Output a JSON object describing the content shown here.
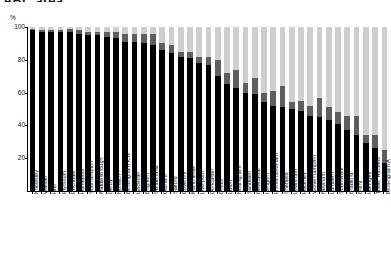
{
  "chart_data": {
    "type": "bar",
    "subtype": "stacked-100-percent",
    "title": "ABC area",
    "title_clipped": true,
    "ylabel": "%",
    "xlabel": "",
    "ylim": [
      0,
      100
    ],
    "yticks": [
      0,
      20,
      40,
      60,
      80,
      100
    ],
    "ytick_labels": [
      "",
      "20",
      "40",
      "60",
      "80",
      "100"
    ],
    "grid": false,
    "legend": "none",
    "colors": {
      "series_1": "#000000",
      "series_2": "#5e5e5e",
      "series_3": "#cfcfcf",
      "axis": "#000000",
      "background": "#ffffff"
    },
    "categories": [
      "Knowsley",
      "Walsall",
      "Hull",
      "Plymouth",
      "Rochdale",
      "Hartlepool",
      "Southampton",
      "Middlesbrough",
      "Derby",
      "Norwich",
      "Birmingham K.N",
      "Leicester",
      "Brighton",
      "Sunderland",
      "Oldham",
      "Salford",
      "Coventry",
      "Manchester",
      "Liverpool",
      "Doncaster",
      "Bristol",
      "Luton",
      "Nottingham",
      "Sandwell",
      "Newcastle",
      "Islington",
      "H'smith&Fulham",
      "Sheffield",
      "Lewisham",
      "Hackney",
      "Wolverhampton",
      "Newham",
      "Lambeth",
      "Southwark",
      "Bradford",
      "Brent",
      "Haringey",
      "Tower Hamlets",
      "Birmingham A"
    ],
    "series": [
      {
        "name": "series_1",
        "color": "#000000",
        "values": [
          98,
          97,
          97,
          97,
          97,
          96,
          95,
          95,
          94,
          93,
          91,
          91,
          90,
          89,
          86,
          84,
          82,
          81,
          78,
          77,
          70,
          65,
          63,
          60,
          59,
          54,
          52,
          51,
          50,
          49,
          46,
          45,
          43,
          41,
          37,
          34,
          29,
          26,
          17
        ]
      },
      {
        "name": "series_2",
        "color": "#5e5e5e",
        "values": [
          1,
          1,
          1,
          1,
          2,
          2,
          2,
          2,
          3,
          4,
          5,
          5,
          6,
          7,
          4,
          5,
          3,
          4,
          4,
          5,
          10,
          7,
          11,
          6,
          10,
          6,
          9,
          13,
          4,
          6,
          6,
          12,
          8,
          7,
          9,
          12,
          5,
          8,
          8
        ]
      },
      {
        "name": "series_3",
        "color": "#cfcfcf",
        "values": [
          1,
          2,
          2,
          2,
          1,
          2,
          3,
          3,
          3,
          3,
          4,
          4,
          4,
          4,
          10,
          11,
          15,
          15,
          18,
          18,
          20,
          28,
          26,
          34,
          31,
          40,
          39,
          36,
          46,
          45,
          48,
          43,
          49,
          52,
          54,
          54,
          66,
          66,
          75
        ]
      }
    ]
  }
}
